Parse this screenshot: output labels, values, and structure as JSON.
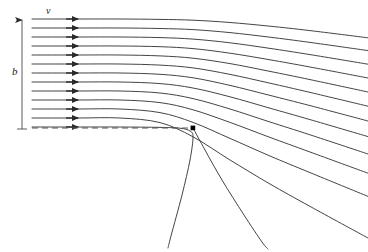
{
  "figure": {
    "width": 368,
    "height": 252,
    "background_color": "#ffffff",
    "line_color": "#3a3a3a",
    "dash_color": "#555555",
    "marker_color": "#000000"
  },
  "labels": {
    "velocity": "v",
    "width": "b"
  },
  "dimension_arrow": {
    "name": "b-dimension-arrow",
    "x": 22,
    "y_top": 18,
    "y_bottom": 129,
    "arrowhead": "up",
    "label": "b"
  },
  "velocity_label": {
    "name": "velocity-label",
    "x": 50,
    "y": 14,
    "text": "v"
  },
  "dashed_wall": {
    "name": "dashed-centerline",
    "x_start": 32,
    "x_end": 193,
    "y": 128,
    "dash_pattern": "6 4"
  },
  "separation_point": {
    "name": "separation-point-marker",
    "x": 193,
    "y": 128,
    "size": 4
  },
  "chart_data": {
    "type": "line",
    "xlabel": "",
    "ylabel": "",
    "xlim": [
      0,
      368
    ],
    "ylim": [
      0,
      252
    ],
    "grid": false,
    "legend": null,
    "notes": [
      "Uniform horizontal inflow of velocity v over inlet width b",
      "Streamlines deflect downward past the separation point at (193,128)",
      "Lower streamlines fan out steeply below the edge"
    ],
    "arrow_x": 78,
    "inlet_x": 32,
    "series": [
      {
        "name": "streamline-01",
        "arrow": true,
        "points": [
          [
            32,
            19
          ],
          [
            78,
            19
          ],
          [
            120,
            19
          ],
          [
            160,
            19.4
          ],
          [
            193,
            20.2
          ],
          [
            230,
            22.5
          ],
          [
            270,
            26.2
          ],
          [
            310,
            30.6
          ],
          [
            368,
            37.8
          ]
        ]
      },
      {
        "name": "streamline-02",
        "arrow": true,
        "points": [
          [
            32,
            28
          ],
          [
            78,
            28
          ],
          [
            120,
            28
          ],
          [
            160,
            28.5
          ],
          [
            193,
            29.6
          ],
          [
            230,
            32.6
          ],
          [
            270,
            37.2
          ],
          [
            310,
            42.4
          ],
          [
            368,
            50.6
          ]
        ]
      },
      {
        "name": "streamline-03",
        "arrow": true,
        "points": [
          [
            32,
            37
          ],
          [
            78,
            37
          ],
          [
            120,
            37
          ],
          [
            160,
            37.6
          ],
          [
            193,
            39.1
          ],
          [
            230,
            42.8
          ],
          [
            270,
            48.4
          ],
          [
            310,
            54.6
          ],
          [
            368,
            64.2
          ]
        ]
      },
      {
        "name": "streamline-04",
        "arrow": true,
        "points": [
          [
            32,
            46
          ],
          [
            78,
            46
          ],
          [
            120,
            46
          ],
          [
            160,
            46.7
          ],
          [
            193,
            48.6
          ],
          [
            230,
            53.2
          ],
          [
            270,
            59.8
          ],
          [
            310,
            67.0
          ],
          [
            368,
            78.0
          ]
        ]
      },
      {
        "name": "streamline-05",
        "arrow": true,
        "points": [
          [
            32,
            55
          ],
          [
            78,
            55
          ],
          [
            120,
            55
          ],
          [
            160,
            55.9
          ],
          [
            193,
            58.2
          ],
          [
            230,
            63.6
          ],
          [
            270,
            71.4
          ],
          [
            310,
            79.6
          ],
          [
            368,
            92.0
          ]
        ]
      },
      {
        "name": "streamline-06",
        "arrow": true,
        "points": [
          [
            32,
            64
          ],
          [
            78,
            64
          ],
          [
            120,
            64
          ],
          [
            160,
            65.1
          ],
          [
            193,
            67.9
          ],
          [
            230,
            74.4
          ],
          [
            270,
            83.2
          ],
          [
            310,
            92.4
          ],
          [
            368,
            106.2
          ]
        ]
      },
      {
        "name": "streamline-07",
        "arrow": true,
        "points": [
          [
            32,
            73
          ],
          [
            78,
            73
          ],
          [
            120,
            73
          ],
          [
            160,
            74.3
          ],
          [
            193,
            77.8
          ],
          [
            230,
            85.4
          ],
          [
            270,
            95.4
          ],
          [
            310,
            105.6
          ],
          [
            368,
            121.0
          ]
        ]
      },
      {
        "name": "streamline-08",
        "arrow": true,
        "points": [
          [
            32,
            82
          ],
          [
            78,
            82
          ],
          [
            120,
            82
          ],
          [
            160,
            83.6
          ],
          [
            193,
            88.0
          ],
          [
            230,
            96.8
          ],
          [
            270,
            108.2
          ],
          [
            310,
            119.6
          ],
          [
            368,
            136.6
          ]
        ]
      },
      {
        "name": "streamline-09",
        "arrow": true,
        "points": [
          [
            32,
            91
          ],
          [
            78,
            91
          ],
          [
            120,
            91
          ],
          [
            160,
            93.0
          ],
          [
            193,
            98.6
          ],
          [
            230,
            109.0
          ],
          [
            270,
            122.0
          ],
          [
            310,
            134.8
          ],
          [
            368,
            154.0
          ]
        ]
      },
      {
        "name": "streamline-10",
        "arrow": true,
        "points": [
          [
            32,
            100
          ],
          [
            78,
            100
          ],
          [
            120,
            100
          ],
          [
            160,
            102.6
          ],
          [
            193,
            109.8
          ],
          [
            230,
            122.4
          ],
          [
            270,
            137.4
          ],
          [
            310,
            152.0
          ],
          [
            368,
            173.2
          ]
        ]
      },
      {
        "name": "streamline-11",
        "arrow": true,
        "points": [
          [
            32,
            109
          ],
          [
            78,
            109
          ],
          [
            120,
            109
          ],
          [
            160,
            112.6
          ],
          [
            193,
            122.4
          ],
          [
            230,
            138.4
          ],
          [
            270,
            156.0
          ],
          [
            310,
            172.6
          ],
          [
            368,
            196.4
          ]
        ]
      },
      {
        "name": "streamline-12",
        "arrow": true,
        "points": [
          [
            32,
            118
          ],
          [
            78,
            118
          ],
          [
            120,
            118
          ],
          [
            160,
            122.6
          ],
          [
            193,
            136.8
          ],
          [
            230,
            160.0
          ],
          [
            270,
            184.0
          ],
          [
            310,
            206.4
          ],
          [
            368,
            238.0
          ]
        ]
      },
      {
        "name": "streamline-13-separating",
        "arrow": true,
        "points": [
          [
            32,
            127
          ],
          [
            78,
            127
          ],
          [
            120,
            127
          ],
          [
            160,
            127.4
          ],
          [
            180,
            128.2
          ],
          [
            190,
            131.0
          ],
          [
            193,
            137.0
          ],
          [
            190,
            160.0
          ],
          [
            182,
            195.0
          ],
          [
            171,
            236.0
          ],
          [
            168,
            248.0
          ]
        ]
      },
      {
        "name": "streamline-14-lower-fan",
        "arrow": false,
        "points": [
          [
            193,
            128
          ],
          [
            205,
            150
          ],
          [
            222,
            180
          ],
          [
            244,
            215
          ],
          [
            262,
            242
          ],
          [
            268,
            249
          ]
        ]
      }
    ]
  }
}
